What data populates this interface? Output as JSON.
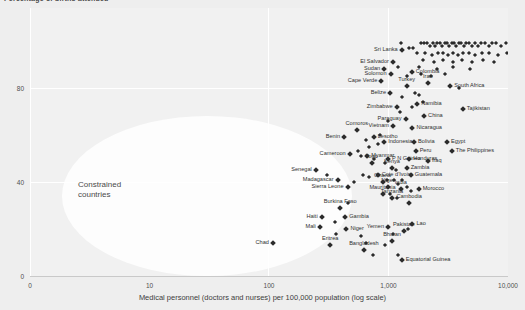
{
  "chart_data": {
    "type": "scatter",
    "title": "Percentage of births attended",
    "xlabel": "Medical personnel (doctors and nurses) per 100,000 population (log scale)",
    "ylabel": "",
    "xticks": [
      "0",
      "10",
      "100",
      "1,000",
      "10,000"
    ],
    "yticks": [
      "0",
      "40",
      "80"
    ],
    "xscale": "log",
    "xlim": [
      1,
      10000
    ],
    "ylim": [
      0,
      100
    ],
    "grid": true,
    "legend": "none",
    "annotations": [
      {
        "text": "Constrained\ncountries",
        "x": 20,
        "y": 42
      }
    ],
    "marker_color": "#2b2b2b",
    "plot_background": "#f1f1f1",
    "gridline_color": "#ffffff",
    "highlight_color": "#fdfdfd",
    "labeled_points": [
      {
        "name": "Sri Lanka",
        "x": 130,
        "y": 96,
        "pos": "r"
      },
      {
        "name": "El Salvador",
        "x": 110,
        "y": 91,
        "pos": "r"
      },
      {
        "name": "Colombia",
        "x": 158,
        "y": 87,
        "pos": "l"
      },
      {
        "name": "Sudan",
        "x": 93,
        "y": 88,
        "pos": "r"
      },
      {
        "name": "Solomon",
        "x": 105,
        "y": 86,
        "pos": "r"
      },
      {
        "name": "Cape Verde",
        "x": 88,
        "y": 83,
        "pos": "r"
      },
      {
        "name": "Turkey",
        "x": 143,
        "y": 81,
        "pos": "c"
      },
      {
        "name": "Iran",
        "x": 215,
        "y": 82,
        "pos": "c"
      },
      {
        "name": "South Africa",
        "x": 330,
        "y": 81,
        "pos": "l"
      },
      {
        "name": "Belize",
        "x": 104,
        "y": 78,
        "pos": "r"
      },
      {
        "name": "Zimbabwe",
        "x": 118,
        "y": 72,
        "pos": "r"
      },
      {
        "name": "Namibia",
        "x": 175,
        "y": 73,
        "pos": "l"
      },
      {
        "name": "Tajikistan",
        "x": 420,
        "y": 71,
        "pos": "l"
      },
      {
        "name": "Paraguay",
        "x": 140,
        "y": 67,
        "pos": "r"
      },
      {
        "name": "China",
        "x": 200,
        "y": 68,
        "pos": "l"
      },
      {
        "name": "Vietnam",
        "x": 110,
        "y": 64,
        "pos": "r"
      },
      {
        "name": "Nicaragua",
        "x": 160,
        "y": 63,
        "pos": "l"
      },
      {
        "name": "Comoros",
        "x": 55,
        "y": 62,
        "pos": "c"
      },
      {
        "name": "Benin",
        "x": 43,
        "y": 59,
        "pos": "r"
      },
      {
        "name": "Lesotho",
        "x": 76,
        "y": 59,
        "pos": "l"
      },
      {
        "name": "Indonesia",
        "x": 93,
        "y": 57,
        "pos": "l"
      },
      {
        "name": "Bolivia",
        "x": 165,
        "y": 57,
        "pos": "l"
      },
      {
        "name": "Peru",
        "x": 170,
        "y": 53,
        "pos": "l"
      },
      {
        "name": "Egypt",
        "x": 310,
        "y": 57,
        "pos": "l"
      },
      {
        "name": "The Philippines",
        "x": 340,
        "y": 53,
        "pos": "l"
      },
      {
        "name": "Cameroon",
        "x": 48,
        "y": 52,
        "pos": "r"
      },
      {
        "name": "Myanmar",
        "x": 67,
        "y": 51,
        "pos": "l"
      },
      {
        "name": "Togo",
        "x": 73,
        "y": 48,
        "pos": "c"
      },
      {
        "name": "P N Guinea",
        "x": 100,
        "y": 50,
        "pos": "l"
      },
      {
        "name": "Honduras",
        "x": 150,
        "y": 50,
        "pos": "l"
      },
      {
        "name": "Iraq",
        "x": 215,
        "y": 49,
        "pos": "l"
      },
      {
        "name": "Kenya",
        "x": 108,
        "y": 46,
        "pos": "c"
      },
      {
        "name": "Zambia",
        "x": 143,
        "y": 46,
        "pos": "l"
      },
      {
        "name": "Senegal",
        "x": 25,
        "y": 45,
        "pos": "r"
      },
      {
        "name": "Cote d'Ivoire",
        "x": 82,
        "y": 43,
        "pos": "l"
      },
      {
        "name": "Guatemala",
        "x": 155,
        "y": 43,
        "pos": "l"
      },
      {
        "name": "Madagascar",
        "x": 38,
        "y": 41,
        "pos": "r"
      },
      {
        "name": "Ghana",
        "x": 90,
        "y": 40,
        "pos": "c"
      },
      {
        "name": "Sierra Leone",
        "x": 46,
        "y": 38,
        "pos": "r"
      },
      {
        "name": "Niger",
        "x": 100,
        "y": 38,
        "pos": "c"
      },
      {
        "name": "India",
        "x": 128,
        "y": 37,
        "pos": "c"
      },
      {
        "name": "Morocco",
        "x": 180,
        "y": 37,
        "pos": "l"
      },
      {
        "name": "Mauritania",
        "x": 90,
        "y": 35,
        "pos": "c"
      },
      {
        "name": "Tanzania",
        "x": 108,
        "y": 33,
        "pos": "c"
      },
      {
        "name": "Cambodia",
        "x": 150,
        "y": 31,
        "pos": "c"
      },
      {
        "name": "Burkina Faso",
        "x": 40,
        "y": 29,
        "pos": "c"
      },
      {
        "name": "Haiti",
        "x": 28,
        "y": 25,
        "pos": "r"
      },
      {
        "name": "Gambia",
        "x": 44,
        "y": 25,
        "pos": "l"
      },
      {
        "name": "Mali",
        "x": 27,
        "y": 21,
        "pos": "r"
      },
      {
        "name": "Niger",
        "x": 45,
        "y": 20,
        "pos": "l"
      },
      {
        "name": "Yemen",
        "x": 100,
        "y": 21,
        "pos": "r"
      },
      {
        "name": "Lao",
        "x": 160,
        "y": 22,
        "pos": "l"
      },
      {
        "name": "Pakistan",
        "x": 135,
        "y": 19,
        "pos": "c"
      },
      {
        "name": "Chad",
        "x": 11,
        "y": 14,
        "pos": "r"
      },
      {
        "name": "Eritrea",
        "x": 33,
        "y": 13,
        "pos": "c"
      },
      {
        "name": "Bhutan",
        "x": 108,
        "y": 15,
        "pos": "c"
      },
      {
        "name": "Bangladesh",
        "x": 63,
        "y": 11,
        "pos": "c"
      },
      {
        "name": "Equatorial Guinea",
        "x": 130,
        "y": 7,
        "pos": "l"
      }
    ],
    "unlabeled_points": [
      {
        "x": 128,
        "y": 99
      },
      {
        "x": 150,
        "y": 97
      },
      {
        "x": 163,
        "y": 97
      },
      {
        "x": 190,
        "y": 99
      },
      {
        "x": 200,
        "y": 99
      },
      {
        "x": 212,
        "y": 99
      },
      {
        "x": 222,
        "y": 98
      },
      {
        "x": 235,
        "y": 99
      },
      {
        "x": 246,
        "y": 98
      },
      {
        "x": 258,
        "y": 99
      },
      {
        "x": 270,
        "y": 99
      },
      {
        "x": 283,
        "y": 98
      },
      {
        "x": 296,
        "y": 99
      },
      {
        "x": 310,
        "y": 99
      },
      {
        "x": 325,
        "y": 98
      },
      {
        "x": 340,
        "y": 99
      },
      {
        "x": 356,
        "y": 99
      },
      {
        "x": 372,
        "y": 98
      },
      {
        "x": 390,
        "y": 99
      },
      {
        "x": 408,
        "y": 99
      },
      {
        "x": 428,
        "y": 98
      },
      {
        "x": 448,
        "y": 99
      },
      {
        "x": 470,
        "y": 99
      },
      {
        "x": 500,
        "y": 98
      },
      {
        "x": 530,
        "y": 99
      },
      {
        "x": 560,
        "y": 98
      },
      {
        "x": 600,
        "y": 99
      },
      {
        "x": 640,
        "y": 99
      },
      {
        "x": 690,
        "y": 98
      },
      {
        "x": 740,
        "y": 99
      },
      {
        "x": 800,
        "y": 99
      },
      {
        "x": 880,
        "y": 98
      },
      {
        "x": 960,
        "y": 99
      },
      {
        "x": 1050,
        "y": 99
      },
      {
        "x": 1150,
        "y": 98
      },
      {
        "x": 1280,
        "y": 99
      },
      {
        "x": 1450,
        "y": 99
      },
      {
        "x": 1700,
        "y": 98
      },
      {
        "x": 176,
        "y": 95
      },
      {
        "x": 205,
        "y": 95
      },
      {
        "x": 232,
        "y": 94
      },
      {
        "x": 260,
        "y": 95
      },
      {
        "x": 288,
        "y": 95
      },
      {
        "x": 316,
        "y": 94
      },
      {
        "x": 348,
        "y": 95
      },
      {
        "x": 380,
        "y": 94
      },
      {
        "x": 420,
        "y": 95
      },
      {
        "x": 470,
        "y": 95
      },
      {
        "x": 530,
        "y": 94
      },
      {
        "x": 610,
        "y": 95
      },
      {
        "x": 700,
        "y": 95
      },
      {
        "x": 820,
        "y": 94
      },
      {
        "x": 980,
        "y": 95
      },
      {
        "x": 1200,
        "y": 95
      },
      {
        "x": 196,
        "y": 92
      },
      {
        "x": 240,
        "y": 91
      },
      {
        "x": 290,
        "y": 92
      },
      {
        "x": 345,
        "y": 91
      },
      {
        "x": 410,
        "y": 92
      },
      {
        "x": 500,
        "y": 91
      },
      {
        "x": 620,
        "y": 92
      },
      {
        "x": 760,
        "y": 91
      },
      {
        "x": 121,
        "y": 89
      },
      {
        "x": 180,
        "y": 89
      },
      {
        "x": 255,
        "y": 88
      },
      {
        "x": 350,
        "y": 89
      },
      {
        "x": 480,
        "y": 88
      },
      {
        "x": 143,
        "y": 85
      },
      {
        "x": 190,
        "y": 86
      },
      {
        "x": 230,
        "y": 85
      },
      {
        "x": 300,
        "y": 86
      },
      {
        "x": 132,
        "y": 76
      },
      {
        "x": 168,
        "y": 78
      },
      {
        "x": 180,
        "y": 77
      },
      {
        "x": 390,
        "y": 80
      },
      {
        "x": 125,
        "y": 70
      },
      {
        "x": 158,
        "y": 72
      },
      {
        "x": 196,
        "y": 74
      },
      {
        "x": 100,
        "y": 66
      },
      {
        "x": 86,
        "y": 60
      },
      {
        "x": 66,
        "y": 58
      },
      {
        "x": 70,
        "y": 55
      },
      {
        "x": 82,
        "y": 56
      },
      {
        "x": 56,
        "y": 53
      },
      {
        "x": 60,
        "y": 51
      },
      {
        "x": 77,
        "y": 50
      },
      {
        "x": 95,
        "y": 48
      },
      {
        "x": 117,
        "y": 45
      },
      {
        "x": 62,
        "y": 43
      },
      {
        "x": 70,
        "y": 42
      },
      {
        "x": 98,
        "y": 41
      },
      {
        "x": 112,
        "y": 41
      },
      {
        "x": 132,
        "y": 41
      },
      {
        "x": 31,
        "y": 43
      },
      {
        "x": 52,
        "y": 40
      },
      {
        "x": 120,
        "y": 39
      },
      {
        "x": 143,
        "y": 38
      },
      {
        "x": 155,
        "y": 36
      },
      {
        "x": 104,
        "y": 35
      },
      {
        "x": 118,
        "y": 33
      },
      {
        "x": 46,
        "y": 31
      },
      {
        "x": 36,
        "y": 23
      },
      {
        "x": 37,
        "y": 18
      },
      {
        "x": 60,
        "y": 17
      },
      {
        "x": 65,
        "y": 14
      },
      {
        "x": 110,
        "y": 18
      },
      {
        "x": 148,
        "y": 20
      },
      {
        "x": 95,
        "y": 13
      },
      {
        "x": 75,
        "y": 9
      },
      {
        "x": 122,
        "y": 9
      }
    ]
  }
}
